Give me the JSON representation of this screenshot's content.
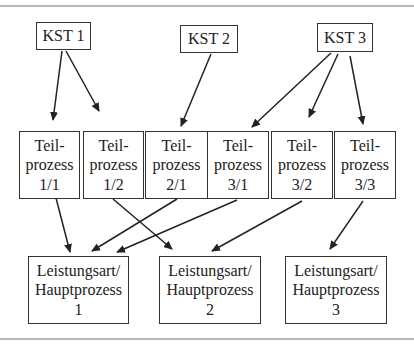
{
  "diagram": {
    "cost_centers": [
      {
        "id": "kst1",
        "label": "KST 1"
      },
      {
        "id": "kst2",
        "label": "KST 2"
      },
      {
        "id": "kst3",
        "label": "KST 3"
      }
    ],
    "sub_processes": [
      {
        "id": "tp11",
        "line1": "Teil-",
        "line2": "prozess",
        "line3": "1/1"
      },
      {
        "id": "tp12",
        "line1": "Teil-",
        "line2": "prozess",
        "line3": "1/2"
      },
      {
        "id": "tp21",
        "line1": "Teil-",
        "line2": "prozess",
        "line3": "2/1"
      },
      {
        "id": "tp31",
        "line1": "Teil-",
        "line2": "prozess",
        "line3": "3/1"
      },
      {
        "id": "tp32",
        "line1": "Teil-",
        "line2": "prozess",
        "line3": "3/2"
      },
      {
        "id": "tp33",
        "line1": "Teil-",
        "line2": "prozess",
        "line3": "3/3"
      }
    ],
    "main_processes": [
      {
        "id": "hp1",
        "line1": "Leistungsart/",
        "line2": "Hauptprozess",
        "line3": "1"
      },
      {
        "id": "hp2",
        "line1": "Leistungsart/",
        "line2": "Hauptprozess",
        "line3": "2"
      },
      {
        "id": "hp3",
        "line1": "Leistungsart/",
        "line2": "Hauptprozess",
        "line3": "3"
      }
    ],
    "edges": [
      {
        "from": "kst1",
        "to": "tp11"
      },
      {
        "from": "kst1",
        "to": "tp12"
      },
      {
        "from": "kst2",
        "to": "tp21"
      },
      {
        "from": "kst3",
        "to": "tp31"
      },
      {
        "from": "kst3",
        "to": "tp32"
      },
      {
        "from": "kst3",
        "to": "tp33"
      },
      {
        "from": "tp11",
        "to": "hp1"
      },
      {
        "from": "tp12",
        "to": "hp2"
      },
      {
        "from": "tp21",
        "to": "hp1"
      },
      {
        "from": "tp31",
        "to": "hp1"
      },
      {
        "from": "tp32",
        "to": "hp2"
      },
      {
        "from": "tp33",
        "to": "hp3"
      }
    ]
  }
}
